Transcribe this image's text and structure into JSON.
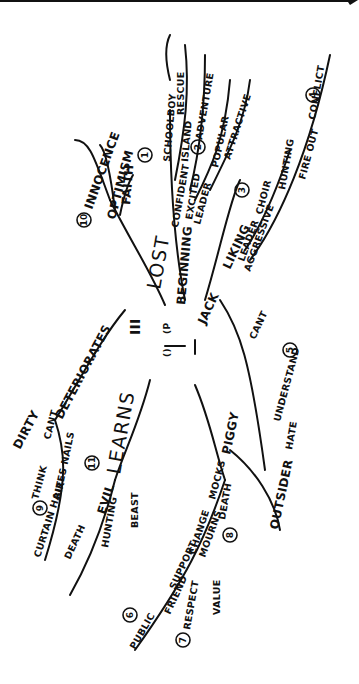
{
  "center": {
    "glyph_a": "III",
    "glyph_b": "(P",
    "glyph_c": "()",
    "glyph_d": "1"
  },
  "branches": {
    "lost": {
      "label": "LOST",
      "number": "10",
      "subs": [
        "INNOCENCE",
        "OPTIMISM",
        "FAITH"
      ]
    },
    "beginning": {
      "label": "BEGINNING",
      "number": "1",
      "subs": [
        "CONFIDENT",
        "SCHOOLBOY",
        "EXCITED",
        "ISLAND",
        "RESCUE",
        "ADVENTURE",
        "LEADER",
        "POPULAR",
        "ATTRACTIVE"
      ],
      "number2": "2"
    },
    "jack": {
      "label": "JACK",
      "number": "3",
      "subs": [
        "LIKING",
        "LEADER",
        "CHOIR",
        "AGGRESSIVE",
        "HUNTING",
        "FIRE OUT",
        "CONFLICT"
      ],
      "number2": "4"
    },
    "hate": {
      "label": "HATE",
      "number": "5",
      "subs": [
        "UNDERSTAND",
        "CANT"
      ]
    },
    "deteriorates": {
      "label": "DETERIORATES",
      "number": "9",
      "subs": [
        "DIRTY",
        "THINK",
        "CANT",
        "BITES NAILS",
        "CURTAIN HAIR"
      ]
    },
    "learns": {
      "label": "LEARNS",
      "number": "11",
      "subs": [
        "EVIL",
        "DEATH",
        "HUNTING",
        "BEAST"
      ]
    },
    "piggy": {
      "label": "PIGGY",
      "number": "6",
      "subs": [
        "MOCKS",
        "CHANGE",
        "SUPPORT",
        "PUBLIC",
        "FRIEND",
        "RESPECT",
        "VALUE",
        "MOURNS",
        "DEATH",
        "OUTSIDER"
      ],
      "number2": "7",
      "number3": "8"
    }
  }
}
